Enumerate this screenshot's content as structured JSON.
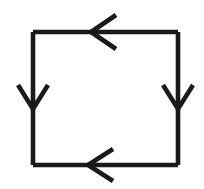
{
  "canvas": {
    "width": 204,
    "height": 189,
    "background_color": "#ffffff"
  },
  "figure": {
    "name": "square-arrow-cycle",
    "shape": "square",
    "stroke_color": "#1a1a1a",
    "stroke_width": 4.6,
    "arrow_stroke_width": 4.6,
    "square": {
      "left": 33,
      "top": 32,
      "right": 178,
      "bottom": 165,
      "width": 145,
      "height": 133
    },
    "edges": [
      {
        "name": "top-edge",
        "x1": 33,
        "y1": 32,
        "x2": 178,
        "y2": 32
      },
      {
        "name": "right-edge",
        "x1": 178,
        "y1": 32,
        "x2": 178,
        "y2": 165
      },
      {
        "name": "bottom-edge",
        "x1": 178,
        "y1": 165,
        "x2": 33,
        "y2": 165
      },
      {
        "name": "left-edge",
        "x1": 33,
        "y1": 165,
        "x2": 33,
        "y2": 32
      }
    ],
    "arrows": [
      {
        "name": "top-arrowhead",
        "side": "top",
        "direction": "left",
        "tip_x": 91,
        "tip_y": 32,
        "wing1_x": 116,
        "wing1_y": 15,
        "wing2_x": 116,
        "wing2_y": 49
      },
      {
        "name": "left-arrowhead",
        "side": "left",
        "direction": "down",
        "tip_x": 33,
        "tip_y": 109,
        "wing1_x": 18,
        "wing1_y": 85,
        "wing2_x": 48,
        "wing2_y": 85
      },
      {
        "name": "right-arrowhead",
        "side": "right",
        "direction": "down",
        "tip_x": 178,
        "tip_y": 109,
        "wing1_x": 163,
        "wing1_y": 85,
        "wing2_x": 193,
        "wing2_y": 85
      },
      {
        "name": "bottom-arrowhead",
        "side": "bottom",
        "direction": "left",
        "tip_x": 88,
        "tip_y": 165,
        "wing1_x": 113,
        "wing1_y": 149,
        "wing2_x": 113,
        "wing2_y": 181
      }
    ]
  }
}
